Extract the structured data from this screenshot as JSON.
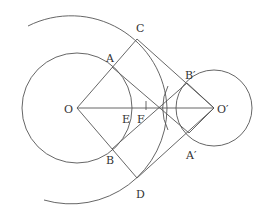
{
  "figure": {
    "type": "geometry-construction",
    "labels": {
      "O": "O",
      "O2": "O′",
      "A": "A",
      "B": "B",
      "C": "C",
      "D": "D",
      "E": "E",
      "F": "F",
      "A2": "A′",
      "B2": "B′"
    },
    "points": {
      "O": [
        77,
        108
      ],
      "O2": [
        214,
        108
      ],
      "A": [
        112,
        67
      ],
      "B": [
        112,
        149
      ],
      "C": [
        137,
        39
      ],
      "D": [
        137,
        178
      ],
      "A2": [
        189,
        133
      ],
      "B2": [
        187,
        83
      ],
      "E": [
        130,
        108
      ],
      "F": [
        146,
        108
      ],
      "X": [
        159,
        108
      ]
    },
    "circles": [
      {
        "name": "circle-O",
        "center": "O",
        "r": 55
      },
      {
        "name": "circle-O2",
        "center": "O2",
        "r": 38
      },
      {
        "name": "big-arc-O",
        "center": "O",
        "r": 91,
        "partial": true
      },
      {
        "name": "arc-E",
        "center": "O2",
        "r": 84,
        "partial": true
      }
    ]
  }
}
